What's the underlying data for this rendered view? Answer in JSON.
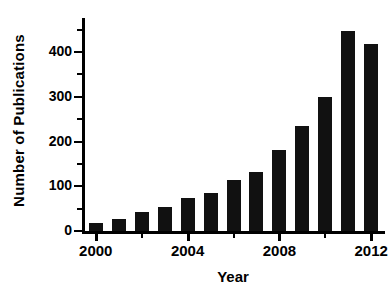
{
  "chart_data": {
    "type": "bar",
    "title": "",
    "subtitle": "",
    "xlabel": "Year",
    "ylabel": "Number of Publications",
    "categories": [
      2000,
      2001,
      2002,
      2003,
      2004,
      2005,
      2006,
      2007,
      2008,
      2009,
      2010,
      2011,
      2012
    ],
    "values": [
      18,
      27,
      42,
      53,
      73,
      84,
      114,
      131,
      181,
      234,
      300,
      448,
      417
    ],
    "series": [
      {
        "name": "Number of Publications",
        "values": [
          18,
          27,
          42,
          53,
          73,
          84,
          114,
          131,
          181,
          234,
          300,
          448,
          417
        ]
      }
    ],
    "ylim": [
      0,
      470
    ],
    "xlim": [
      1999.4,
      2012.6
    ],
    "y_ticks": [
      0,
      100,
      200,
      300,
      400
    ],
    "y_ticklabels": [
      "0",
      "100",
      "200",
      "300",
      "400"
    ],
    "y_minor_ticks": [
      50,
      150,
      250,
      350,
      450
    ],
    "x_ticks": [
      2000,
      2004,
      2008,
      2012
    ],
    "x_ticklabels": [
      "2000",
      "2004",
      "2008",
      "2012"
    ],
    "x_minor_ticks": [
      2002,
      2006,
      2010
    ],
    "grid": false,
    "legend": false,
    "legend_position": "none",
    "bar_color": "#111111",
    "background_color": "#ffffff",
    "axis_color": "#000000",
    "annotations": []
  }
}
